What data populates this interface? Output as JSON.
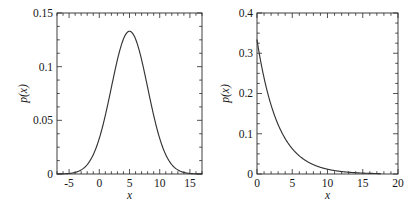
{
  "figure": {
    "background": "#ffffff",
    "line_color": "#333333",
    "axis_color": "#2a2a2a",
    "panel_count": 2
  },
  "chart_data": [
    {
      "type": "line",
      "title": "",
      "xlabel": "x",
      "ylabel": "p(x)",
      "xlim": [
        -7,
        17
      ],
      "ylim": [
        0,
        0.15
      ],
      "grid": false,
      "legend": null,
      "xticks": [
        -5,
        0,
        5,
        10,
        15
      ],
      "xticklabels": [
        "-5",
        "0",
        "5",
        "10",
        "15"
      ],
      "yticks": [
        0,
        0.05,
        0.1,
        0.15
      ],
      "yticklabels": [
        "0",
        "0.05",
        "0.1",
        "0.15"
      ],
      "xminor_step": 1,
      "yminor_step": 0.0125,
      "distribution": "gaussian",
      "params": {
        "mu": 5,
        "sigma": 3,
        "peak": 0.133
      },
      "x": [
        -7,
        -6,
        -5,
        -4,
        -3,
        -2,
        -1,
        0,
        1,
        2,
        3,
        4,
        5,
        6,
        7,
        8,
        9,
        10,
        11,
        12,
        13,
        14,
        15,
        16,
        17
      ],
      "y": [
        0.0001,
        0.0003,
        0.0009,
        0.0022,
        0.0051,
        0.0108,
        0.0208,
        0.0365,
        0.0585,
        0.0857,
        0.1148,
        0.1305,
        0.133,
        0.1305,
        0.1148,
        0.0857,
        0.0585,
        0.0365,
        0.0208,
        0.0108,
        0.0051,
        0.0022,
        0.0009,
        0.0003,
        0.0001
      ]
    },
    {
      "type": "line",
      "title": "",
      "xlabel": "x",
      "ylabel": "p(x)",
      "xlim": [
        0,
        20
      ],
      "ylim": [
        0,
        0.4
      ],
      "grid": false,
      "legend": null,
      "xticks": [
        0,
        5,
        10,
        15,
        20
      ],
      "xticklabels": [
        "0",
        "5",
        "10",
        "15",
        "20"
      ],
      "yticks": [
        0,
        0.1,
        0.2,
        0.3,
        0.4
      ],
      "yticklabels": [
        "0",
        "0.1",
        "0.2",
        "0.3",
        "0.4"
      ],
      "xminor_step": 1,
      "yminor_step": 0.025,
      "distribution": "exponential",
      "params": {
        "lambda": 0.3333,
        "mean": 3,
        "value_at_zero": 0.333
      },
      "x": [
        0,
        1,
        2,
        3,
        4,
        5,
        6,
        7,
        8,
        9,
        10,
        11,
        12,
        13,
        14,
        15,
        16,
        17,
        17.5
      ],
      "y": [
        0.3333,
        0.2388,
        0.1711,
        0.1226,
        0.0878,
        0.0629,
        0.0451,
        0.0323,
        0.0231,
        0.0166,
        0.0119,
        0.0085,
        0.0061,
        0.0044,
        0.0031,
        0.0022,
        0.0016,
        0.0011,
        0.001
      ]
    }
  ]
}
